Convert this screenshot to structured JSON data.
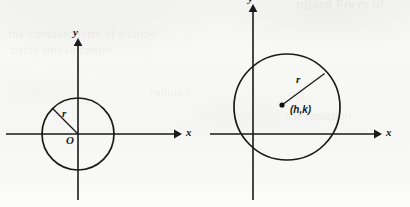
{
  "page": {
    "width": 410,
    "height": 207,
    "background_color": "#f7f7f6",
    "ink_color": "#1a1a1a"
  },
  "ghost_bleedthrough": [
    {
      "text": "ndard Form of",
      "x": 296,
      "y": -3,
      "size": 13
    },
    {
      "text": "the standard form of a circle",
      "x": 8,
      "y": 28,
      "size": 11
    },
    {
      "text": "circle whose center",
      "x": 10,
      "y": 44,
      "size": 11
    },
    {
      "text": "e a",
      "x": 288,
      "y": 88,
      "size": 12
    },
    {
      "text": "radius r",
      "x": 150,
      "y": 86,
      "size": 11
    },
    {
      "text": "the equation",
      "x": 286,
      "y": 110,
      "size": 11
    }
  ],
  "diagrams": [
    {
      "id": "circle-at-origin",
      "name": "circle-centered-at-origin",
      "axes": {
        "x_axis": {
          "y": 134,
          "x_start": 6,
          "x_end": 178,
          "label": "x",
          "label_x": 186,
          "label_y": 128
        },
        "y_axis": {
          "x": 78,
          "y_start": 42,
          "y_end": 200,
          "label": "y",
          "label_x": 72,
          "label_y": 28
        }
      },
      "circle": {
        "cx": 78,
        "cy": 134,
        "r": 36
      },
      "radius_segment": {
        "x1": 78,
        "y1": 134,
        "x2": 52.6,
        "y2": 108.5,
        "label": "r",
        "label_x": 63,
        "label_y": 110
      },
      "origin": {
        "label": "O",
        "label_x": 67,
        "label_y": 136
      },
      "center_dot": null
    },
    {
      "id": "circle-at-h-k",
      "name": "circle-centered-at-h-k",
      "axes": {
        "x_axis": {
          "y": 134,
          "x_start": 210,
          "x_end": 378,
          "label": "x",
          "label_x": 386,
          "label_y": 128
        },
        "y_axis": {
          "x": 253,
          "y_start": 8,
          "y_end": 200,
          "label": "y",
          "label_x": 247,
          "label_y": -6
        }
      },
      "circle": {
        "cx": 287,
        "cy": 107,
        "r": 53
      },
      "radius_segment": {
        "x1": 282,
        "y1": 105,
        "x2": 324.6,
        "y2": 73.4,
        "label": "r",
        "label_x": 297,
        "label_y": 76
      },
      "origin": null,
      "center_dot": {
        "cx": 282,
        "cy": 105,
        "r": 2.6
      },
      "center_label": {
        "text": "(h,k)",
        "label_x": 291,
        "label_y": 108
      }
    }
  ]
}
